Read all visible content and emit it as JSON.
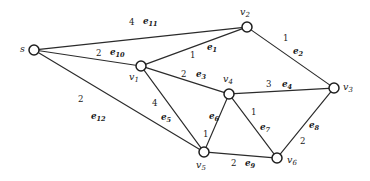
{
  "figure": {
    "kind": "undirected-weighted-graph",
    "background_color": "#ffffff",
    "line_color": "#2b2b2b",
    "node_fill": "#ffffff",
    "node_stroke": "#1e1e1e",
    "width": 370,
    "height": 181
  },
  "nodes": [
    {
      "id": "s",
      "label": "s",
      "sub": "",
      "x": 34,
      "y": 50,
      "r": 5.0,
      "label_x": 20,
      "label_y": 44
    },
    {
      "id": "v1",
      "label": "v",
      "sub": "1",
      "x": 141,
      "y": 66,
      "r": 5.0,
      "label_x": 129,
      "label_y": 72
    },
    {
      "id": "v2",
      "label": "v",
      "sub": "2",
      "x": 247,
      "y": 27,
      "r": 5.0,
      "label_x": 240,
      "label_y": 7
    },
    {
      "id": "v3",
      "label": "v",
      "sub": "3",
      "x": 334,
      "y": 88,
      "r": 5.0,
      "label_x": 343,
      "label_y": 82
    },
    {
      "id": "v4",
      "label": "v",
      "sub": "4",
      "x": 229,
      "y": 94,
      "r": 5.0,
      "label_x": 223,
      "label_y": 74
    },
    {
      "id": "v5",
      "label": "v",
      "sub": "5",
      "x": 204,
      "y": 152,
      "r": 5.0,
      "label_x": 196,
      "label_y": 160
    },
    {
      "id": "v6",
      "label": "v",
      "sub": "6",
      "x": 277,
      "y": 158,
      "r": 5.0,
      "label_x": 287,
      "label_y": 155
    }
  ],
  "edges": [
    {
      "id": "e1",
      "name": "e",
      "sub": "1",
      "weight": "1",
      "from": "v1",
      "to": "v2",
      "name_x": 207,
      "name_y": 43,
      "weight_x": 190,
      "weight_y": 51
    },
    {
      "id": "e2",
      "name": "e",
      "sub": "2",
      "weight": "1",
      "from": "v2",
      "to": "v3",
      "name_x": 293,
      "name_y": 47,
      "weight_x": 283,
      "weight_y": 34
    },
    {
      "id": "e3",
      "name": "e",
      "sub": "3",
      "weight": "2",
      "from": "v1",
      "to": "v4",
      "name_x": 196,
      "name_y": 70,
      "weight_x": 181,
      "weight_y": 70
    },
    {
      "id": "e4",
      "name": "e",
      "sub": "4",
      "weight": "3",
      "from": "v4",
      "to": "v3",
      "name_x": 282,
      "name_y": 80,
      "weight_x": 266,
      "weight_y": 80
    },
    {
      "id": "e5",
      "name": "e",
      "sub": "5",
      "weight": "4",
      "from": "v1",
      "to": "v5",
      "name_x": 161,
      "name_y": 113,
      "weight_x": 152,
      "weight_y": 99
    },
    {
      "id": "e6",
      "name": "e",
      "sub": "6",
      "weight": "1",
      "from": "v4",
      "to": "v5",
      "name_x": 209,
      "name_y": 112,
      "weight_x": 203,
      "weight_y": 130
    },
    {
      "id": "e7",
      "name": "e",
      "sub": "7",
      "weight": "1",
      "from": "v4",
      "to": "v6",
      "name_x": 260,
      "name_y": 123,
      "weight_x": 251,
      "weight_y": 108
    },
    {
      "id": "e8",
      "name": "e",
      "sub": "8",
      "weight": "2",
      "from": "v3",
      "to": "v6",
      "name_x": 309,
      "name_y": 121,
      "weight_x": 300,
      "weight_y": 137
    },
    {
      "id": "e9",
      "name": "e",
      "sub": "9",
      "weight": "2",
      "from": "v5",
      "to": "v6",
      "name_x": 245,
      "name_y": 159,
      "weight_x": 231,
      "weight_y": 159
    },
    {
      "id": "e10",
      "name": "e",
      "sub": "10",
      "weight": "2",
      "from": "s",
      "to": "v1",
      "name_x": 110,
      "name_y": 48,
      "weight_x": 96,
      "weight_y": 49
    },
    {
      "id": "e11",
      "name": "e",
      "sub": "11",
      "weight": "4",
      "from": "s",
      "to": "v2",
      "name_x": 143,
      "name_y": 17,
      "weight_x": 129,
      "weight_y": 18
    },
    {
      "id": "e12",
      "name": "e",
      "sub": "12",
      "weight": "2",
      "from": "s",
      "to": "v5",
      "name_x": 91,
      "name_y": 112,
      "weight_x": 78,
      "weight_y": 95
    }
  ]
}
